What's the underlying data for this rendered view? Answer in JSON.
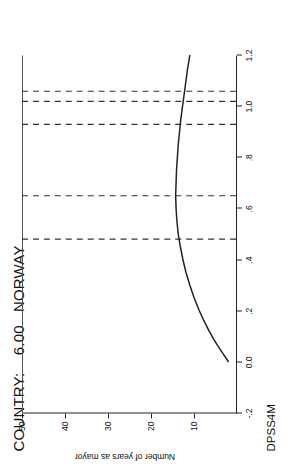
{
  "figure": {
    "title": "COUNTRY:    6.00   NORWAY",
    "background_color": "#ffffff",
    "ink_color": "#1a1a1a",
    "rotation": "90deg-ccw"
  },
  "axes": {
    "x_label": "DPSS4M",
    "y_label": "Number of years as mayor"
  },
  "chart_data": {
    "type": "line",
    "title": "COUNTRY:    6.00   NORWAY",
    "xlabel": "DPSS4M",
    "ylabel": "Number of years as mayor",
    "xlim": [
      -0.2,
      1.2
    ],
    "ylim": [
      0,
      50
    ],
    "xticks": [
      -0.2,
      0.0,
      0.2,
      0.4,
      0.6,
      0.8,
      1.0,
      1.2
    ],
    "xticklabels": [
      "-.2",
      "0.0",
      ".2",
      ".4",
      ".6",
      ".8",
      "1.0",
      "1.2"
    ],
    "yticks": [
      10,
      20,
      30,
      40,
      50
    ],
    "yticklabels": [
      "10",
      "20",
      "30",
      "40",
      "50"
    ],
    "grid": false,
    "legend": null,
    "series": [
      {
        "name": "fitted curve",
        "style": "solid",
        "x": [
          0.0,
          0.03,
          0.06,
          0.09,
          0.12,
          0.16,
          0.2,
          0.25,
          0.3,
          0.35,
          0.4,
          0.45,
          0.5,
          0.55,
          0.6,
          0.65,
          0.7,
          0.75,
          0.8,
          0.85,
          0.9,
          0.95,
          1.0,
          1.05,
          1.1,
          1.15,
          1.2
        ],
        "y": [
          1.8,
          3.0,
          4.2,
          5.3,
          6.3,
          7.5,
          8.6,
          9.8,
          10.8,
          11.7,
          12.4,
          13.0,
          13.5,
          13.8,
          14.0,
          14.1,
          14.0,
          13.9,
          13.7,
          13.5,
          13.2,
          12.9,
          12.5,
          12.1,
          11.7,
          11.3,
          10.8
        ]
      }
    ],
    "reference_lines": {
      "style": "dashed",
      "orientation": "vertical",
      "x": [
        0.48,
        0.65,
        0.93,
        1.02,
        1.06
      ],
      "extent_note": "dashed rug lines spanning the plot width at observed DPSS4M values"
    }
  }
}
